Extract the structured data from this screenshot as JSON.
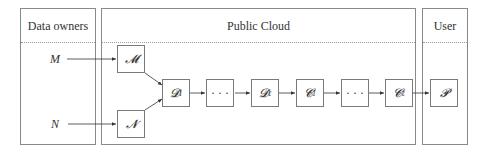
{
  "panels": {
    "data_owners": {
      "title": "Data owners"
    },
    "public_cloud": {
      "title": "Public Cloud"
    },
    "user": {
      "title": "User"
    }
  },
  "inputs": {
    "m": "M",
    "n": "N"
  },
  "nodes": {
    "enc_m": {
      "main": "𝓜",
      "sub": ""
    },
    "enc_n": {
      "main": "𝓝",
      "sub": ""
    },
    "d1": {
      "main": "𝓓",
      "sub": "1"
    },
    "dots1": {
      "main": "· · ·",
      "sub": ""
    },
    "dl": {
      "main": "𝓓",
      "sub": "ℓ"
    },
    "c1": {
      "main": "𝓒",
      "sub": "1"
    },
    "dots2": {
      "main": "· · ·",
      "sub": ""
    },
    "cl": {
      "main": "𝓒",
      "sub": "ℓ"
    },
    "p": {
      "main": "𝓟",
      "sub": ""
    }
  },
  "colors": {
    "border": "#8a8a8a",
    "text": "#333333",
    "arrow": "#333333"
  }
}
